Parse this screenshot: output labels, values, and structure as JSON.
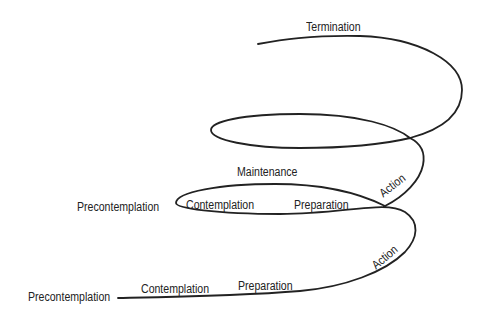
{
  "diagram": {
    "line_color": "#222222",
    "labels": {
      "bottom": {
        "precontemplation": "Precontemplation",
        "contemplation": "Contemplation",
        "preparation": "Preparation",
        "action": "Action"
      },
      "middle": {
        "precontemplation": "Precontemplation",
        "contemplation": "Contemplation",
        "preparation": "Preparation",
        "maintenance": "Maintenance",
        "action": "Action"
      },
      "top": {
        "termination": "Termination"
      }
    }
  }
}
